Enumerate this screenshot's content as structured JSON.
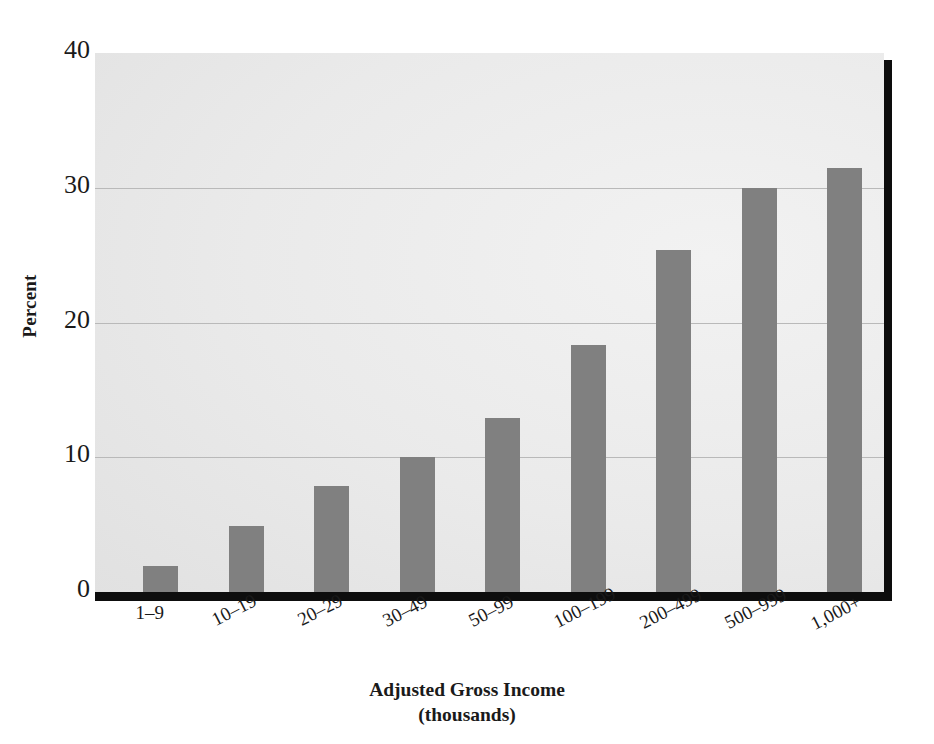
{
  "chart_data": {
    "type": "bar",
    "title": "",
    "xlabel": "Adjusted Gross Income",
    "xlabel_sub": "(thousands)",
    "ylabel": "Percent",
    "ylim": [
      0,
      40
    ],
    "yticks": [
      0,
      10,
      20,
      30,
      40
    ],
    "ytick_labels": [
      "0",
      "10",
      "20",
      "30",
      "40"
    ],
    "grid": true,
    "grid_axis": "y",
    "legend": "none",
    "categories": [
      "1–9",
      "10–19",
      "20–29",
      "30–49",
      "50–99",
      "100–199",
      "200–499",
      "500–999",
      "1,000+"
    ],
    "values": [
      1.9,
      4.9,
      7.9,
      10.0,
      12.9,
      18.3,
      25.4,
      30.0,
      31.5
    ],
    "series": [
      {
        "name": "Percent",
        "values": [
          1.9,
          4.9,
          7.9,
          10.0,
          12.9,
          18.3,
          25.4,
          30.0,
          31.5
        ]
      }
    ]
  },
  "colors": {
    "bar": "#808080",
    "plot_background": "#e8e8e8",
    "gridline": "#b9b9b9",
    "axis_spine": "#0d0d0d",
    "text": "#1a1a1a",
    "figure_background": "#ffffff"
  },
  "axis": {
    "y_title": "Percent",
    "x_title": "Adjusted Gross Income",
    "x_title_sub": "(thousands)"
  }
}
